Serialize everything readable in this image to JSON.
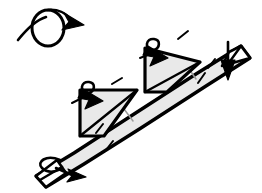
{
  "figure": {
    "kind": "origami-folding-diagram",
    "title": "",
    "canvas": {
      "width": 262,
      "height": 193
    },
    "background_color": "#ffffff"
  },
  "palette": {
    "paper_fill": "#e9e9e9",
    "paper_tip_fill": "#ffffff",
    "outline": "#000000",
    "soft_crease": "#9a9a9a"
  },
  "symbols": {
    "turn_over": {
      "name": "turn-over-arrow",
      "description": "looped rotate arrow",
      "ring": {
        "cx": 48,
        "cy": 28,
        "rx": 16,
        "ry": 18
      },
      "tail": {
        "x1": 18,
        "y1": 40,
        "x2": 44,
        "y2": 18
      },
      "head_points": "68,19 84,26 68,32 72,26"
    },
    "fold_arrow_upper": {
      "name": "fold-in-arrow-upper-flap",
      "head_points": "163,50 158,66 150,58 147,64 145,48 161,44",
      "loop": {
        "cx": 154,
        "cy": 44,
        "rx": 6,
        "ry": 7
      }
    },
    "fold_arrow_lower": {
      "name": "fold-in-arrow-lower-flap",
      "head_points": "98,93 93,108 85,100 82,106 80,90 96,87",
      "loop": {
        "cx": 89,
        "cy": 87,
        "rx": 6,
        "ry": 7
      }
    },
    "down_arrow_right": {
      "name": "pull-down-arrow-right",
      "tail": {
        "x1": 228,
        "y1": 42,
        "x2": 228,
        "y2": 66
      },
      "head_points": "221,62 235,62 228,80"
    },
    "curl_arrow_bottom_left": {
      "name": "curl-arrow-bottom-left",
      "loop": {
        "cx": 50,
        "cy": 162,
        "rx": 12,
        "ry": 7
      },
      "tail": {
        "x1": 56,
        "y1": 168,
        "x2": 74,
        "y2": 176
      },
      "head_points": "70,170 86,178 69,182"
    }
  },
  "tick_marks": [
    {
      "name": "tick-upper-right-of-upper-flap",
      "x1": 178,
      "y1": 39,
      "x2": 188,
      "y2": 31
    },
    {
      "name": "tick-left-of-upper-flap",
      "x1": 140,
      "y1": 58,
      "x2": 150,
      "y2": 54
    },
    {
      "name": "tick-right-band-upper",
      "x1": 198,
      "y1": 83,
      "x2": 205,
      "y2": 73
    },
    {
      "name": "tick-right-band-lower",
      "x1": 208,
      "y1": 68,
      "x2": 215,
      "y2": 59
    },
    {
      "name": "tick-upper-right-of-lower-flap",
      "x1": 112,
      "y1": 84,
      "x2": 122,
      "y2": 78
    },
    {
      "name": "tick-left-of-lower-flap",
      "x1": 72,
      "y1": 103,
      "x2": 82,
      "y2": 98
    },
    {
      "name": "tick-band-mid",
      "x1": 96,
      "y1": 133,
      "x2": 103,
      "y2": 124
    },
    {
      "name": "tick-band-low",
      "x1": 106,
      "y1": 150,
      "x2": 113,
      "y2": 141
    }
  ],
  "paper_shapes": {
    "band": {
      "name": "main-paper-band",
      "points": "36,176 74,153 131,116 196,74 241,46 250,58 206,86 141,128 84,164 46,187"
    },
    "lower_flap": {
      "name": "lower-triangular-flap",
      "points": "80,90 137,90 104,136 80,136"
    },
    "upper_flap": {
      "name": "upper-triangular-flap",
      "points": "145,48 200,62 167,92 145,92"
    },
    "lower_flap_crease": {
      "name": "lower-flap-fold-crease",
      "x1": 80,
      "y1": 136,
      "x2": 137,
      "y2": 90
    },
    "upper_flap_crease": {
      "name": "upper-flap-fold-crease",
      "x1": 145,
      "y1": 92,
      "x2": 200,
      "y2": 62
    }
  },
  "band_creases": [
    {
      "name": "band-crease-near-lower-flap",
      "x1": 124,
      "y1": 109,
      "x2": 133,
      "y2": 121
    },
    {
      "name": "band-crease-near-upper-flap",
      "x1": 187,
      "y1": 66,
      "x2": 196,
      "y2": 79
    },
    {
      "name": "band-crease-bottom-left",
      "x1": 57,
      "y1": 160,
      "x2": 66,
      "y2": 173
    }
  ],
  "tips": {
    "top_right": {
      "name": "top-right-folded-tip",
      "points": "241,46 250,58 222,66 229,52",
      "inner_line": {
        "x1": 241,
        "y1": 46,
        "x2": 228,
        "y2": 64
      }
    },
    "bottom_left": {
      "name": "bottom-left-folded-tip",
      "points": "36,176 46,187 66,173 57,160",
      "inner_line": {
        "x1": 40,
        "y1": 180,
        "x2": 62,
        "y2": 167
      }
    }
  }
}
